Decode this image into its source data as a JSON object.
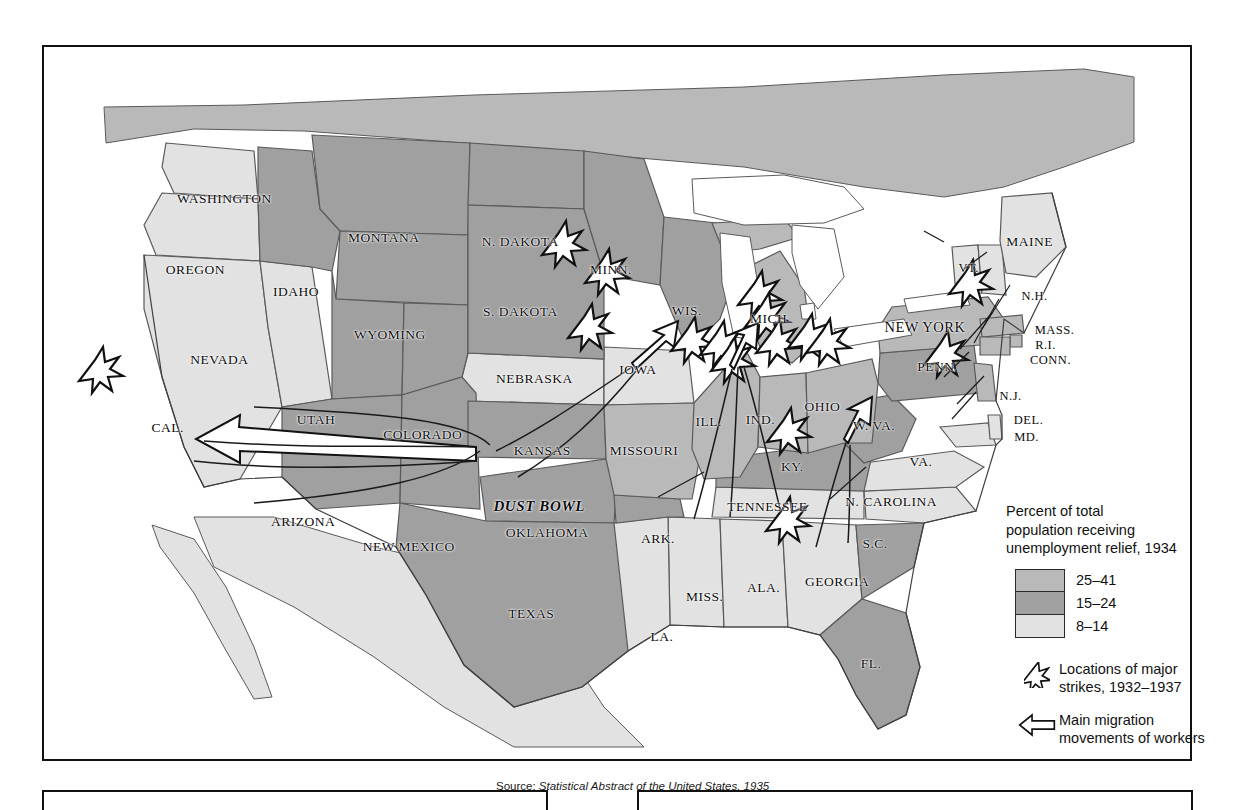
{
  "map": {
    "title_source": "Source:",
    "source_italic": "Statistical Abstract of the United States, 1935",
    "dust_bowl_label": "DUST BOWL",
    "colors": {
      "high": "#b9b9b9",
      "mid": "#a0a0a0",
      "low": "#e2e2e2",
      "water": "#ffffff",
      "outline": "#4a4a4a",
      "coast": "#555555",
      "ink": "#111111"
    },
    "states": [
      {
        "name": "WASHINGTON",
        "x": 181,
        "y": 153,
        "size": "sz-md",
        "tier": "low"
      },
      {
        "name": "OREGON",
        "x": 152,
        "y": 224,
        "size": "sz-md",
        "tier": "low"
      },
      {
        "name": "IDAHO",
        "x": 253,
        "y": 246,
        "size": "sz-md",
        "tier": "mid"
      },
      {
        "name": "MONTANA",
        "x": 341,
        "y": 192,
        "size": "sz-md",
        "tier": "mid"
      },
      {
        "name": "N. DAKOTA",
        "x": 478,
        "y": 196,
        "size": "sz-md",
        "tier": "mid"
      },
      {
        "name": "S. DAKOTA",
        "x": 478,
        "y": 266,
        "size": "sz-md",
        "tier": "mid"
      },
      {
        "name": "MINN.",
        "x": 569,
        "y": 224,
        "size": "sz-md",
        "tier": "mid"
      },
      {
        "name": "WIS.",
        "x": 645,
        "y": 265,
        "size": "sz-md",
        "tier": "mid"
      },
      {
        "name": "MICH.",
        "x": 729,
        "y": 274,
        "size": "sz-md",
        "tier": "high"
      },
      {
        "name": "NEW YORK",
        "x": 884,
        "y": 282,
        "size": "sz-lg",
        "tier": "high"
      },
      {
        "name": "MAINE",
        "x": 989,
        "y": 196,
        "size": "sz-md",
        "tier": "low"
      },
      {
        "name": "VT.",
        "x": 928,
        "y": 222,
        "size": "sz-sm",
        "tier": "low"
      },
      {
        "name": "N.H.",
        "x": 994,
        "y": 250,
        "size": "sz-sm",
        "tier": "low"
      },
      {
        "name": "MASS.",
        "x": 1014,
        "y": 285,
        "size": "sz-sm",
        "tier": "high"
      },
      {
        "name": "R.I.",
        "x": 1005,
        "y": 300,
        "size": "sz-sm",
        "tier": "high"
      },
      {
        "name": "CONN.",
        "x": 1010,
        "y": 315,
        "size": "sz-sm",
        "tier": "high"
      },
      {
        "name": "N.J.",
        "x": 970,
        "y": 351,
        "size": "sz-sm",
        "tier": "high"
      },
      {
        "name": "PENN.",
        "x": 897,
        "y": 322,
        "size": "sz-md",
        "tier": "mid"
      },
      {
        "name": "DEL.",
        "x": 988,
        "y": 375,
        "size": "sz-sm",
        "tier": "low"
      },
      {
        "name": "MD.",
        "x": 986,
        "y": 392,
        "size": "sz-sm",
        "tier": "low"
      },
      {
        "name": "OHIO",
        "x": 781,
        "y": 362,
        "size": "sz-md",
        "tier": "high"
      },
      {
        "name": "IND.",
        "x": 719,
        "y": 375,
        "size": "sz-md",
        "tier": "high"
      },
      {
        "name": "ILL.",
        "x": 667,
        "y": 377,
        "size": "sz-md",
        "tier": "high"
      },
      {
        "name": "IOWA",
        "x": 596,
        "y": 325,
        "size": "sz-md",
        "tier": "low"
      },
      {
        "name": "NEBRASKA",
        "x": 492,
        "y": 334,
        "size": "sz-md",
        "tier": "low"
      },
      {
        "name": "WYOMING",
        "x": 347,
        "y": 290,
        "size": "sz-md",
        "tier": "mid"
      },
      {
        "name": "NEVADA",
        "x": 176,
        "y": 315,
        "size": "sz-md",
        "tier": "low"
      },
      {
        "name": "UTAH",
        "x": 273,
        "y": 375,
        "size": "sz-md",
        "tier": "mid"
      },
      {
        "name": "COLORADO",
        "x": 380,
        "y": 390,
        "size": "sz-md",
        "tier": "mid"
      },
      {
        "name": "KANSAS",
        "x": 500,
        "y": 406,
        "size": "sz-md",
        "tier": "mid"
      },
      {
        "name": "MISSOURI",
        "x": 602,
        "y": 406,
        "size": "sz-md",
        "tier": "high"
      },
      {
        "name": "KY.",
        "x": 751,
        "y": 422,
        "size": "sz-md",
        "tier": "mid"
      },
      {
        "name": "W. VA.",
        "x": 833,
        "y": 381,
        "size": "sz-md",
        "tier": "mid"
      },
      {
        "name": "VA.",
        "x": 880,
        "y": 417,
        "size": "sz-md",
        "tier": "low"
      },
      {
        "name": "CAL.",
        "x": 124,
        "y": 383,
        "size": "sz-md",
        "tier": "low"
      },
      {
        "name": "ARIZONA",
        "x": 260,
        "y": 478,
        "size": "sz-md",
        "tier": "mid"
      },
      {
        "name": "NEW MEXICO",
        "x": 366,
        "y": 503,
        "size": "sz-md",
        "tier": "mid"
      },
      {
        "name": "OKLAHOMA",
        "x": 505,
        "y": 489,
        "size": "sz-md",
        "tier": "mid"
      },
      {
        "name": "ARK.",
        "x": 616,
        "y": 495,
        "size": "sz-md",
        "tier": "mid"
      },
      {
        "name": "TENNESSEE",
        "x": 726,
        "y": 463,
        "size": "sz-md",
        "tier": "low"
      },
      {
        "name": "N. CAROLINA",
        "x": 850,
        "y": 458,
        "size": "sz-md",
        "tier": "low"
      },
      {
        "name": "S.C.",
        "x": 834,
        "y": 500,
        "size": "sz-md",
        "tier": "mid"
      },
      {
        "name": "GEORGIA",
        "x": 796,
        "y": 538,
        "size": "sz-md",
        "tier": "low"
      },
      {
        "name": "ALA.",
        "x": 722,
        "y": 544,
        "size": "sz-md",
        "tier": "low"
      },
      {
        "name": "MISS.",
        "x": 663,
        "y": 553,
        "size": "sz-md",
        "tier": "low"
      },
      {
        "name": "LA.",
        "x": 620,
        "y": 593,
        "size": "sz-md",
        "tier": "low"
      },
      {
        "name": "TEXAS",
        "x": 489,
        "y": 570,
        "size": "sz-md",
        "tier": "mid"
      },
      {
        "name": "FL.",
        "x": 830,
        "y": 620,
        "size": "sz-md",
        "tier": "mid"
      }
    ]
  },
  "legend": {
    "title_line1": "Percent of total",
    "title_line2": "population receiving",
    "title_line3": "unemployment relief, 1934",
    "classes": [
      {
        "label": "25–41",
        "color": "#b9b9b9"
      },
      {
        "label": "15–24",
        "color": "#a0a0a0"
      },
      {
        "label": "8–14",
        "color": "#e2e2e2"
      }
    ],
    "strikes_line1": "Locations of major",
    "strikes_line2": "strikes, 1932–1937",
    "migration_line1": "Main migration",
    "migration_line2": "movements of workers"
  },
  "chart_data": {
    "type": "map",
    "title": "Percent of total population receiving unemployment relief, 1934",
    "source": "Statistical Abstract of the United States, 1935",
    "legend_classes": [
      "25–41",
      "15–24",
      "8–14"
    ],
    "state_values": [
      {
        "state": "WASHINGTON",
        "class": "8–14"
      },
      {
        "state": "OREGON",
        "class": "8–14"
      },
      {
        "state": "CAL.",
        "class": "8–14"
      },
      {
        "state": "NEVADA",
        "class": "8–14"
      },
      {
        "state": "IDAHO",
        "class": "15–24"
      },
      {
        "state": "MONTANA",
        "class": "15–24"
      },
      {
        "state": "WYOMING",
        "class": "15–24"
      },
      {
        "state": "UTAH",
        "class": "15–24"
      },
      {
        "state": "COLORADO",
        "class": "15–24"
      },
      {
        "state": "ARIZONA",
        "class": "15–24"
      },
      {
        "state": "NEW MEXICO",
        "class": "15–24"
      },
      {
        "state": "N. DAKOTA",
        "class": "15–24"
      },
      {
        "state": "S. DAKOTA",
        "class": "15–24"
      },
      {
        "state": "NEBRASKA",
        "class": "8–14"
      },
      {
        "state": "KANSAS",
        "class": "15–24"
      },
      {
        "state": "OKLAHOMA",
        "class": "15–24"
      },
      {
        "state": "TEXAS",
        "class": "15–24"
      },
      {
        "state": "MINN.",
        "class": "15–24"
      },
      {
        "state": "IOWA",
        "class": "8–14"
      },
      {
        "state": "MISSOURI",
        "class": "25–41"
      },
      {
        "state": "ARK.",
        "class": "15–24"
      },
      {
        "state": "LA.",
        "class": "8–14"
      },
      {
        "state": "WIS.",
        "class": "15–24"
      },
      {
        "state": "ILL.",
        "class": "25–41"
      },
      {
        "state": "MICH.",
        "class": "25–41"
      },
      {
        "state": "IND.",
        "class": "25–41"
      },
      {
        "state": "OHIO",
        "class": "25–41"
      },
      {
        "state": "KY.",
        "class": "15–24"
      },
      {
        "state": "TENNESSEE",
        "class": "8–14"
      },
      {
        "state": "MISS.",
        "class": "8–14"
      },
      {
        "state": "ALA.",
        "class": "8–14"
      },
      {
        "state": "GEORGIA",
        "class": "8–14"
      },
      {
        "state": "FL.",
        "class": "15–24"
      },
      {
        "state": "S.C.",
        "class": "15–24"
      },
      {
        "state": "N. CAROLINA",
        "class": "8–14"
      },
      {
        "state": "VA.",
        "class": "8–14"
      },
      {
        "state": "W. VA.",
        "class": "15–24"
      },
      {
        "state": "MD.",
        "class": "8–14"
      },
      {
        "state": "DEL.",
        "class": "8–14"
      },
      {
        "state": "PENN.",
        "class": "15–24"
      },
      {
        "state": "NEW YORK",
        "class": "25–41"
      },
      {
        "state": "N.J.",
        "class": "25–41"
      },
      {
        "state": "CONN.",
        "class": "25–41"
      },
      {
        "state": "R.I.",
        "class": "25–41"
      },
      {
        "state": "MASS.",
        "class": "25–41"
      },
      {
        "state": "VT.",
        "class": "8–14"
      },
      {
        "state": "N.H.",
        "class": "8–14"
      },
      {
        "state": "MAINE",
        "class": "8–14"
      }
    ],
    "strike_locations": [
      {
        "near": "CAL. (San Francisco)",
        "x": 95,
        "y": 370
      },
      {
        "near": "MINN. (Minneapolis)",
        "x": 554,
        "y": 238
      },
      {
        "near": "WIS.",
        "x": 597,
        "y": 268
      },
      {
        "near": "IOWA",
        "x": 580,
        "y": 323
      },
      {
        "near": "ILL. (Chicago)",
        "x": 683,
        "y": 336
      },
      {
        "near": "ILL./IND.",
        "x": 712,
        "y": 340
      },
      {
        "near": "IND.",
        "x": 723,
        "y": 356
      },
      {
        "near": "MICH. (Flint)",
        "x": 750,
        "y": 290
      },
      {
        "near": "MICH. (Detroit)",
        "x": 757,
        "y": 312
      },
      {
        "near": "OHIO (Toledo)",
        "x": 768,
        "y": 338
      },
      {
        "near": "OHIO (Cleveland)",
        "x": 800,
        "y": 333
      },
      {
        "near": "OHIO/PENN.",
        "x": 818,
        "y": 338
      },
      {
        "near": "KY.",
        "x": 779,
        "y": 427
      },
      {
        "near": "PENN./N.J.",
        "x": 936,
        "y": 350
      },
      {
        "near": "GEORGIA",
        "x": 778,
        "y": 516
      },
      {
        "near": "MASS.",
        "x": 961,
        "y": 279
      }
    ],
    "migration_arrows": [
      {
        "from": "Dust Bowl / Oklahoma region",
        "to": "California",
        "label": "Main migration movements of workers"
      },
      {
        "from": "Missouri / Kansas region",
        "to": "Illinois / Midwest"
      },
      {
        "from": "Tennessee / South",
        "to": "Ohio Valley"
      },
      {
        "from": "Georgia / S.C.",
        "to": "Virginia / Northeast"
      }
    ]
  }
}
